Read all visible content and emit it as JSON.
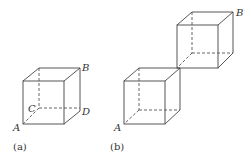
{
  "figure_a": {
    "caption": "(a)",
    "labels": {
      "A": "A",
      "B": "B",
      "C": "C",
      "D": "D"
    }
  },
  "figure_b": {
    "caption": "(b)",
    "labels": {
      "A": "A",
      "B": "B"
    }
  },
  "colors": {
    "line": "#444444",
    "text": "#333333",
    "background": "#ffffff"
  }
}
